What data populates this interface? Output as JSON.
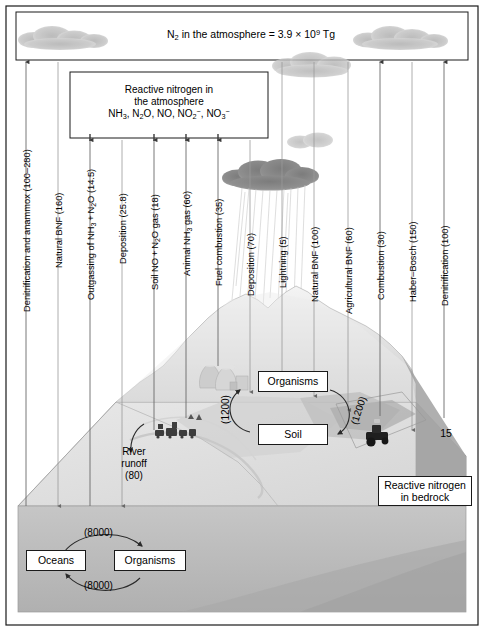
{
  "figure": {
    "title_atmosphere": "N2 in the atmosphere = 3.9 x 10^9 Tg",
    "atmosphere_box": {
      "n2_prefix": "N",
      "n2_sub": "2",
      "n2_text": " in the atmosphere = 3.9 × 10",
      "n2_exp": "9",
      "n2_suffix": " Tg"
    },
    "reactive_box": {
      "line1": "Reactive nitrogen in",
      "line2": "the atmosphere",
      "species_l1": "NH",
      "species_l1_sub": "3",
      "species_l2": ", N",
      "species_l2_sub": "2",
      "species_l3": "O, NO, NO",
      "species_l3_sub": "2",
      "species_l3_sup": "−",
      "species_l4": ", NO",
      "species_l4_sub": "3",
      "species_l4_sup": "−"
    }
  },
  "flux_labels": [
    {
      "id": "denitrification-anammox",
      "text": "Denitrification and anammox (100–280)",
      "value_range": [
        100,
        280
      ],
      "x": 26,
      "direction": "up"
    },
    {
      "id": "natural-bnf-ocean",
      "text": "Natural BNF (160)",
      "value": 160,
      "x": 58,
      "direction": "down"
    },
    {
      "id": "outgassing",
      "text": "Outgassing of NH3 + N2O (14.5)",
      "value": 14.5,
      "x": 90,
      "direction": "up",
      "rich": true
    },
    {
      "id": "deposition-ocean",
      "text": "Deposition (25.8)",
      "value": 25.8,
      "x": 122,
      "direction": "down"
    },
    {
      "id": "soil-no-n2o",
      "text": "Soil NO + N2O gas (18)",
      "value": 18,
      "x": 154,
      "direction": "up",
      "rich": true
    },
    {
      "id": "animal-nh3",
      "text": "Animal NH3 gas (60)",
      "value": 60,
      "x": 186,
      "direction": "up",
      "rich": true
    },
    {
      "id": "fuel-combustion",
      "text": "Fuel combustion (35)",
      "value": 35,
      "x": 218,
      "direction": "up"
    },
    {
      "id": "deposition-land",
      "text": "Deposition (70)",
      "value": 70,
      "x": 250,
      "direction": "down"
    },
    {
      "id": "lightning",
      "text": "Lightning (5)",
      "value": 5,
      "x": 282,
      "direction": "down"
    },
    {
      "id": "natural-bnf-land",
      "text": "Natural BNF (100)",
      "value": 100,
      "x": 314,
      "direction": "down"
    },
    {
      "id": "agricultural-bnf",
      "text": "Agricultural BNF (60)",
      "value": 60,
      "x": 348,
      "direction": "down"
    },
    {
      "id": "combustion",
      "text": "Combustion (30)",
      "value": 30,
      "x": 380,
      "direction": "up"
    },
    {
      "id": "haber-bosch",
      "text": "Haber–Bosch (150)",
      "value": 150,
      "x": 412,
      "direction": "down"
    },
    {
      "id": "denitrification",
      "text": "Denitrification (100)",
      "value": 100,
      "x": 444,
      "direction": "up"
    }
  ],
  "land": {
    "organisms_box": "Organisms",
    "soil_box": "Soil",
    "cycle_left_value": "(1200)",
    "cycle_right_value": "(1200)",
    "river_runoff_line1": "River",
    "river_runoff_line2": "runoff",
    "river_runoff_line3": "(80)",
    "bedrock_line1": "Reactive nitrogen",
    "bedrock_line2": "in bedrock",
    "bedrock_value": "15"
  },
  "ocean": {
    "oceans_box": "Oceans",
    "organisms_box": "Organisms",
    "top_value": "(8000)",
    "bottom_value": "(8000)"
  },
  "colors": {
    "line": "#4a4a4a",
    "frame": "#1a1a1a",
    "land_light": "#e3e3e3",
    "land_mid": "#cfcfcf",
    "land_dark": "#b4b4b4",
    "ocean": "#bdbdbd",
    "cloud": "#bcbcbc",
    "rain_cloud": "#8a8a8a"
  }
}
